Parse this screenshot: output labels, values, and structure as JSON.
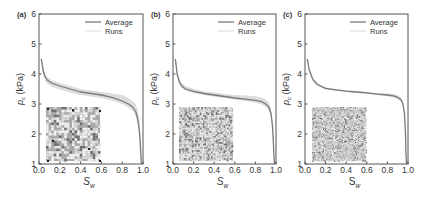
{
  "chart_data": [
    {
      "type": "line",
      "panel_label": "(a)",
      "xlabel": "S_w",
      "ylabel": "p_c (kPa)",
      "xlim": [
        0.0,
        1.0
      ],
      "ylim": [
        1,
        6
      ],
      "xticks": [
        "0.0",
        "0.2",
        "0.4",
        "0.6",
        "0.8",
        "1.0"
      ],
      "yticks": [
        "1",
        "2",
        "3",
        "4",
        "5",
        "6"
      ],
      "grid": false,
      "legend": [
        "Average",
        "Runs"
      ],
      "legend_position": "upper right",
      "inset": "porous medium image (coarse grains)",
      "series": [
        {
          "name": "Average",
          "x": [
            0.02,
            0.025,
            0.04,
            0.06,
            0.08,
            0.12,
            0.2,
            0.3,
            0.4,
            0.5,
            0.6,
            0.7,
            0.8,
            0.86,
            0.9,
            0.93,
            0.95,
            0.965,
            0.975,
            0.98,
            0.985
          ],
          "y": [
            4.5,
            4.45,
            4.1,
            3.9,
            3.8,
            3.7,
            3.6,
            3.5,
            3.4,
            3.35,
            3.3,
            3.22,
            3.1,
            3.0,
            2.9,
            2.75,
            2.5,
            2.1,
            1.6,
            1.3,
            1.0
          ]
        },
        {
          "name": "Runs",
          "band_upper": [
            4.5,
            4.5,
            4.2,
            4.0,
            3.9,
            3.8,
            3.7,
            3.6,
            3.5,
            3.45,
            3.4,
            3.35,
            3.3,
            3.2,
            3.1,
            3.0,
            2.8,
            2.4,
            1.9,
            1.5,
            1.0
          ],
          "band_lower": [
            4.4,
            4.3,
            4.0,
            3.78,
            3.68,
            3.58,
            3.48,
            3.38,
            3.3,
            3.25,
            3.2,
            3.12,
            3.0,
            2.88,
            2.78,
            2.6,
            2.3,
            1.9,
            1.4,
            1.15,
            1.0
          ]
        }
      ]
    },
    {
      "type": "line",
      "panel_label": "(b)",
      "xlabel": "S_w",
      "ylabel": "p_c (kPa)",
      "xlim": [
        0.0,
        1.0
      ],
      "ylim": [
        1,
        6
      ],
      "xticks": [
        "0.0",
        "0.2",
        "0.4",
        "0.6",
        "0.8",
        "1.0"
      ],
      "yticks": [
        "1",
        "2",
        "3",
        "4",
        "5",
        "6"
      ],
      "grid": false,
      "legend": [
        "Average",
        "Runs"
      ],
      "legend_position": "upper right",
      "inset": "porous medium image (medium grains)",
      "series": [
        {
          "name": "Average",
          "x": [
            0.02,
            0.025,
            0.04,
            0.06,
            0.08,
            0.12,
            0.2,
            0.3,
            0.4,
            0.5,
            0.6,
            0.7,
            0.8,
            0.86,
            0.9,
            0.93,
            0.95,
            0.965,
            0.975,
            0.98,
            0.985
          ],
          "y": [
            4.5,
            4.45,
            4.0,
            3.75,
            3.62,
            3.5,
            3.42,
            3.35,
            3.3,
            3.25,
            3.2,
            3.16,
            3.12,
            3.08,
            3.0,
            2.9,
            2.7,
            2.3,
            1.7,
            1.3,
            1.0
          ]
        },
        {
          "name": "Runs",
          "band_upper": [
            4.5,
            4.5,
            4.1,
            3.85,
            3.72,
            3.6,
            3.5,
            3.42,
            3.38,
            3.33,
            3.3,
            3.28,
            3.26,
            3.22,
            3.15,
            3.05,
            2.85,
            2.45,
            1.85,
            1.4,
            1.0
          ],
          "band_lower": [
            4.4,
            4.35,
            3.9,
            3.68,
            3.55,
            3.44,
            3.36,
            3.3,
            3.24,
            3.2,
            3.15,
            3.1,
            3.05,
            2.98,
            2.9,
            2.78,
            2.55,
            2.15,
            1.55,
            1.2,
            1.0
          ]
        }
      ]
    },
    {
      "type": "line",
      "panel_label": "(c)",
      "xlabel": "S_w",
      "ylabel": "p_c (kPa)",
      "xlim": [
        0.0,
        1.0
      ],
      "ylim": [
        1,
        6
      ],
      "xticks": [
        "0.0",
        "0.2",
        "0.4",
        "0.6",
        "0.8",
        "1.0"
      ],
      "yticks": [
        "1",
        "2",
        "3",
        "4",
        "5",
        "6"
      ],
      "grid": false,
      "legend": [
        "Average",
        "Runs"
      ],
      "legend_position": "upper right",
      "inset": "porous medium image (fine grains)",
      "series": [
        {
          "name": "Average",
          "x": [
            0.02,
            0.025,
            0.04,
            0.06,
            0.08,
            0.12,
            0.2,
            0.3,
            0.4,
            0.5,
            0.6,
            0.7,
            0.8,
            0.86,
            0.9,
            0.93,
            0.95,
            0.965,
            0.975,
            0.98,
            0.985
          ],
          "y": [
            4.5,
            4.45,
            4.15,
            3.95,
            3.8,
            3.65,
            3.52,
            3.47,
            3.43,
            3.4,
            3.37,
            3.33,
            3.3,
            3.27,
            3.22,
            3.15,
            3.0,
            2.7,
            2.1,
            1.4,
            1.0
          ]
        },
        {
          "name": "Runs",
          "band_upper": [
            4.5,
            4.5,
            4.2,
            4.0,
            3.85,
            3.7,
            3.56,
            3.5,
            3.46,
            3.43,
            3.4,
            3.37,
            3.35,
            3.33,
            3.29,
            3.22,
            3.08,
            2.8,
            2.2,
            1.5,
            1.0
          ],
          "band_lower": [
            4.45,
            4.4,
            4.1,
            3.9,
            3.75,
            3.6,
            3.48,
            3.44,
            3.4,
            3.37,
            3.34,
            3.3,
            3.26,
            3.22,
            3.16,
            3.08,
            2.92,
            2.6,
            2.0,
            1.3,
            1.0
          ]
        }
      ]
    }
  ],
  "panels": [
    {
      "label": "(a)",
      "plot": {
        "left": 39,
        "right": 143,
        "top": 14,
        "bottom": 164
      },
      "inset": {
        "x": 46,
        "y": 107,
        "w": 54,
        "h": 54,
        "grain": 2.6,
        "density": 0.55
      }
    },
    {
      "label": "(b)",
      "plot": {
        "left": 173,
        "right": 276,
        "top": 14,
        "bottom": 164
      },
      "inset": {
        "x": 179,
        "y": 107,
        "w": 54,
        "h": 54,
        "grain": 1.6,
        "density": 0.6
      }
    },
    {
      "label": "(c)",
      "plot": {
        "left": 305,
        "right": 408,
        "top": 14,
        "bottom": 164
      },
      "inset": {
        "x": 312,
        "y": 107,
        "w": 54,
        "h": 54,
        "grain": 1.1,
        "density": 0.62
      }
    }
  ],
  "legend": {
    "average_label": "Average",
    "runs_label": "Runs"
  },
  "axis_labels": {
    "x_main": "S",
    "x_sub": "w",
    "y_main": "p",
    "y_sub": "c",
    "y_unit": " (kPa)"
  },
  "colors": {
    "average_line": "#7a7a7a",
    "runs_band": "#dcdcdc",
    "runs_line": "#e2e2e2",
    "axis": "#555555",
    "text": "#333333",
    "inset_dark": "#6e6e6e",
    "inset_light": "#f2f2f2"
  }
}
